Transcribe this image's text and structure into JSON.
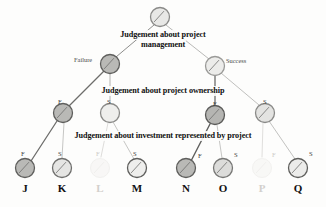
{
  "diagram": {
    "type": "decision-tree",
    "title_bands": [
      {
        "id": "band-management",
        "lines": [
          "Judgement about project",
          "management"
        ],
        "x": 163,
        "y": 30
      },
      {
        "id": "band-ownership",
        "lines": [
          "Judgement about project ownership"
        ],
        "x": 163,
        "y": 86
      },
      {
        "id": "band-investment",
        "lines": [
          "Judgement about investment represented by project"
        ],
        "x": 163,
        "y": 131
      }
    ],
    "branch_labels": [
      {
        "id": "branch-failure",
        "text": "Failure",
        "x": 74,
        "y": 56
      },
      {
        "id": "branch-success",
        "text": "Success",
        "x": 226,
        "y": 57
      }
    ],
    "edge_labels": [
      {
        "id": "edge-l2-left-F",
        "text": "F",
        "x": 58,
        "y": 98,
        "faded": false
      },
      {
        "id": "edge-l2-left-S",
        "text": "S",
        "x": 107,
        "y": 98,
        "faded": false
      },
      {
        "id": "edge-l2-right-F",
        "text": "F",
        "x": 213,
        "y": 100,
        "faded": false
      },
      {
        "id": "edge-l2-right-S",
        "text": "S",
        "x": 263,
        "y": 98,
        "faded": false
      },
      {
        "id": "edge-leaf-J-F",
        "text": "F",
        "x": 21,
        "y": 150,
        "faded": false
      },
      {
        "id": "edge-leaf-K-S",
        "text": "S",
        "x": 58,
        "y": 150,
        "faded": false
      },
      {
        "id": "edge-leaf-L-F",
        "text": "F",
        "x": 96,
        "y": 150,
        "faded": true
      },
      {
        "id": "edge-leaf-M-S",
        "text": "S",
        "x": 133,
        "y": 150,
        "faded": false
      },
      {
        "id": "edge-leaf-N-F",
        "text": "F",
        "x": 198,
        "y": 152,
        "faded": false
      },
      {
        "id": "edge-leaf-O-S",
        "text": "S",
        "x": 234,
        "y": 151,
        "faded": false
      },
      {
        "id": "edge-leaf-P-F",
        "text": "F",
        "x": 272,
        "y": 151,
        "faded": true
      },
      {
        "id": "edge-leaf-Q-S",
        "text": "S",
        "x": 309,
        "y": 150,
        "faded": false
      }
    ],
    "nodes": [
      {
        "id": "node-root",
        "label": "",
        "cx": 160,
        "cy": 17,
        "r": 9.5,
        "fill": "#e8e8e6",
        "stroke": "#8a8a88",
        "faded": false,
        "tick": true
      },
      {
        "id": "node-failure",
        "label": "",
        "cx": 110,
        "cy": 64,
        "r": 9.5,
        "fill": "#b9b9b6",
        "stroke": "#5f5f5d",
        "faded": false,
        "tick": true
      },
      {
        "id": "node-success",
        "label": "",
        "cx": 215,
        "cy": 66,
        "r": 9.5,
        "fill": "#ececea",
        "stroke": "#9a9a98",
        "faded": false,
        "tick": true
      },
      {
        "id": "node-l3-a",
        "label": "",
        "cx": 63,
        "cy": 113,
        "r": 9.5,
        "fill": "#b9b9b6",
        "stroke": "#5f5f5d",
        "faded": false,
        "tick": true
      },
      {
        "id": "node-l3-b",
        "label": "",
        "cx": 110,
        "cy": 113,
        "r": 9.5,
        "fill": "#eeeeec",
        "stroke": "#8a8a88",
        "faded": false,
        "tick": false
      },
      {
        "id": "node-l3-c",
        "label": "",
        "cx": 215,
        "cy": 115,
        "r": 9.5,
        "fill": "#b5b5b2",
        "stroke": "#5a5a58",
        "faded": false,
        "tick": true
      },
      {
        "id": "node-l3-d",
        "label": "",
        "cx": 265,
        "cy": 113,
        "r": 9.5,
        "fill": "#e3e3e1",
        "stroke": "#8a8a88",
        "faded": false,
        "tick": true
      }
    ],
    "leaves": [
      {
        "id": "leaf-J",
        "label": "J",
        "cx": 25,
        "cy": 168,
        "r": 9.5,
        "fill": "#b9b9b6",
        "stroke": "#5f5f5d",
        "faded": false,
        "tick": true
      },
      {
        "id": "leaf-K",
        "label": "K",
        "cx": 62,
        "cy": 168,
        "r": 9.5,
        "fill": "#e5e5e3",
        "stroke": "#6f6f6d",
        "faded": false,
        "tick": true
      },
      {
        "id": "leaf-L",
        "label": "L",
        "cx": 100,
        "cy": 168,
        "r": 9.5,
        "fill": "#f2f1ef",
        "stroke": "#e0dfdb",
        "faded": true,
        "tick": true
      },
      {
        "id": "leaf-M",
        "label": "M",
        "cx": 137,
        "cy": 168,
        "r": 9.5,
        "fill": "#eeeeec",
        "stroke": "#5f5f5d",
        "faded": false,
        "tick": true
      },
      {
        "id": "leaf-N",
        "label": "N",
        "cx": 186,
        "cy": 168,
        "r": 9.5,
        "fill": "#b9b9b6",
        "stroke": "#5f5f5d",
        "faded": false,
        "tick": true
      },
      {
        "id": "leaf-O",
        "label": "O",
        "cx": 223,
        "cy": 168,
        "r": 9.5,
        "fill": "#dcdcda",
        "stroke": "#777775",
        "faded": false,
        "tick": true
      },
      {
        "id": "leaf-P",
        "label": "P",
        "cx": 262,
        "cy": 168,
        "r": 9.5,
        "fill": "#f3f2f0",
        "stroke": "#e2e1dd",
        "faded": true,
        "tick": true
      },
      {
        "id": "leaf-Q",
        "label": "Q",
        "cx": 298,
        "cy": 168,
        "r": 9.5,
        "fill": "#ececea",
        "stroke": "#5f5f5d",
        "faded": false,
        "tick": true
      }
    ],
    "edges": [
      {
        "id": "edge-root-failure",
        "x1": 154,
        "y1": 25,
        "x2": 116,
        "y2": 57,
        "stroke": "#8e8e8c",
        "width": 1.0
      },
      {
        "id": "edge-root-success",
        "x1": 166,
        "y1": 25,
        "x2": 209,
        "y2": 59,
        "stroke": "#b9b9b7",
        "width": 1.0
      },
      {
        "id": "edge-failure-a",
        "x1": 104,
        "y1": 71,
        "x2": 69,
        "y2": 106,
        "stroke": "#6d6d6b",
        "width": 1.3
      },
      {
        "id": "edge-failure-b",
        "x1": 110,
        "y1": 74,
        "x2": 110,
        "y2": 103,
        "stroke": "#b2b2b0",
        "width": 1.0
      },
      {
        "id": "edge-success-c",
        "x1": 215,
        "y1": 76,
        "x2": 215,
        "y2": 105,
        "stroke": "#6d6d6b",
        "width": 1.3
      },
      {
        "id": "edge-success-d",
        "x1": 221,
        "y1": 73,
        "x2": 259,
        "y2": 105,
        "stroke": "#c0c0be",
        "width": 1.0
      },
      {
        "id": "edge-a-J",
        "x1": 57,
        "y1": 121,
        "x2": 31,
        "y2": 161,
        "stroke": "#6d6d6b",
        "width": 1.3
      },
      {
        "id": "edge-a-K",
        "x1": 64,
        "y1": 123,
        "x2": 62,
        "y2": 158,
        "stroke": "#c6c6c4",
        "width": 1.0
      },
      {
        "id": "edge-b-L",
        "x1": 108,
        "y1": 123,
        "x2": 101,
        "y2": 157,
        "stroke": "#dedddb",
        "width": 1.0
      },
      {
        "id": "edge-b-M",
        "x1": 113,
        "y1": 122,
        "x2": 134,
        "y2": 159,
        "stroke": "#c6c6c4",
        "width": 1.0
      },
      {
        "id": "edge-c-N",
        "x1": 210,
        "y1": 124,
        "x2": 191,
        "y2": 161,
        "stroke": "#5f5f5d",
        "width": 1.4
      },
      {
        "id": "edge-c-O",
        "x1": 217,
        "y1": 125,
        "x2": 222,
        "y2": 158,
        "stroke": "#c6c6c4",
        "width": 1.0
      },
      {
        "id": "edge-d-P",
        "x1": 263,
        "y1": 123,
        "x2": 262,
        "y2": 157,
        "stroke": "#e0dfdd",
        "width": 1.0
      },
      {
        "id": "edge-d-Q",
        "x1": 269,
        "y1": 121,
        "x2": 295,
        "y2": 159,
        "stroke": "#c2c2c0",
        "width": 1.0
      }
    ]
  }
}
